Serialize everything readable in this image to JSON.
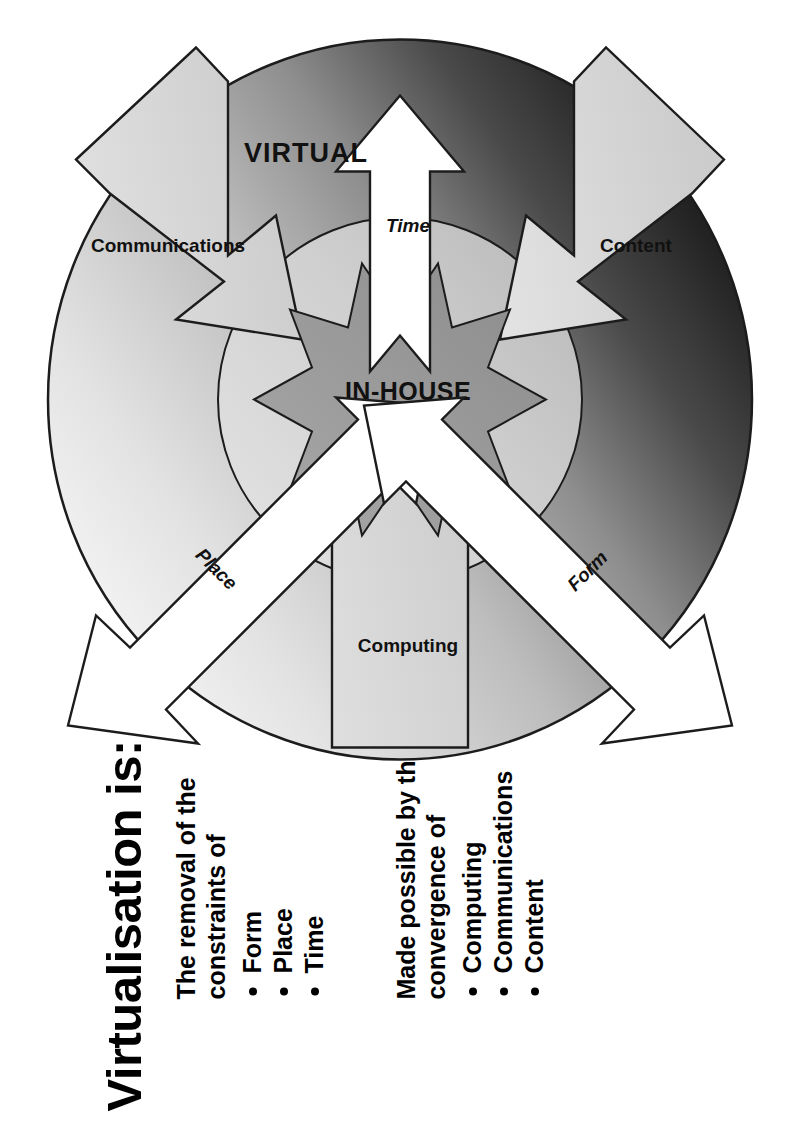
{
  "slide": {
    "title": "Virtualisation is:",
    "rotation_degrees": -90,
    "background_color": "#ffffff"
  },
  "text_blocks": [
    {
      "lead": "The removal of the constraints of",
      "bullets": [
        "Form",
        "Place",
        "Time"
      ]
    },
    {
      "lead": "Made possible by the convergence of",
      "bullets": [
        "Computing",
        "Communications",
        "Content"
      ]
    }
  ],
  "diagram": {
    "name": "virtualisation-circle-diagram",
    "center_label": "IN-HOUSE",
    "outer_label": "VIRTUAL",
    "inbound_arrows": [
      {
        "label": "Computing",
        "style": "plain",
        "direction": "inward"
      },
      {
        "label": "Communications",
        "style": "plain",
        "direction": "inward"
      },
      {
        "label": "Content",
        "style": "plain",
        "direction": "inward"
      }
    ],
    "outbound_arrows": [
      {
        "label": "Place",
        "style": "italic",
        "direction": "outward"
      },
      {
        "label": "Form",
        "style": "italic",
        "direction": "outward"
      },
      {
        "label": "Time",
        "style": "italic",
        "direction": "outward"
      }
    ],
    "colors": {
      "outer_light": "#f2f2f2",
      "outer_mid": "#b5b5b5",
      "outer_dark": "#151515",
      "inner_ring": "#d3d3d3",
      "center_star": "#9a9a9a",
      "arrow_fill_light": "#d8d8d8",
      "arrow_fill_white": "#ffffff",
      "stroke": "#1c1c1c"
    }
  }
}
